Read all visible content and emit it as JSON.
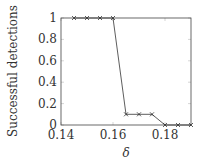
{
  "chart_data": {
    "type": "line",
    "title": "",
    "xlabel": "δ",
    "ylabel": "Successful detections",
    "xlim": [
      0.14,
      0.19
    ],
    "ylim": [
      0,
      1
    ],
    "xticks": [
      "0.14",
      "0.16",
      "0.18"
    ],
    "yticks": [
      "0",
      "0.2",
      "0.4",
      "0.6",
      "0.8",
      "1"
    ],
    "grid": false,
    "marker": "x",
    "series": [
      {
        "name": "detections",
        "x": [
          0.145,
          0.15,
          0.155,
          0.16,
          0.165,
          0.17,
          0.175,
          0.18,
          0.185,
          0.19
        ],
        "values": [
          1,
          1,
          1,
          1,
          0.1,
          0.1,
          0.1,
          0,
          0,
          0
        ]
      }
    ]
  },
  "colors": {
    "line": "#333333",
    "axis": "#444444"
  }
}
